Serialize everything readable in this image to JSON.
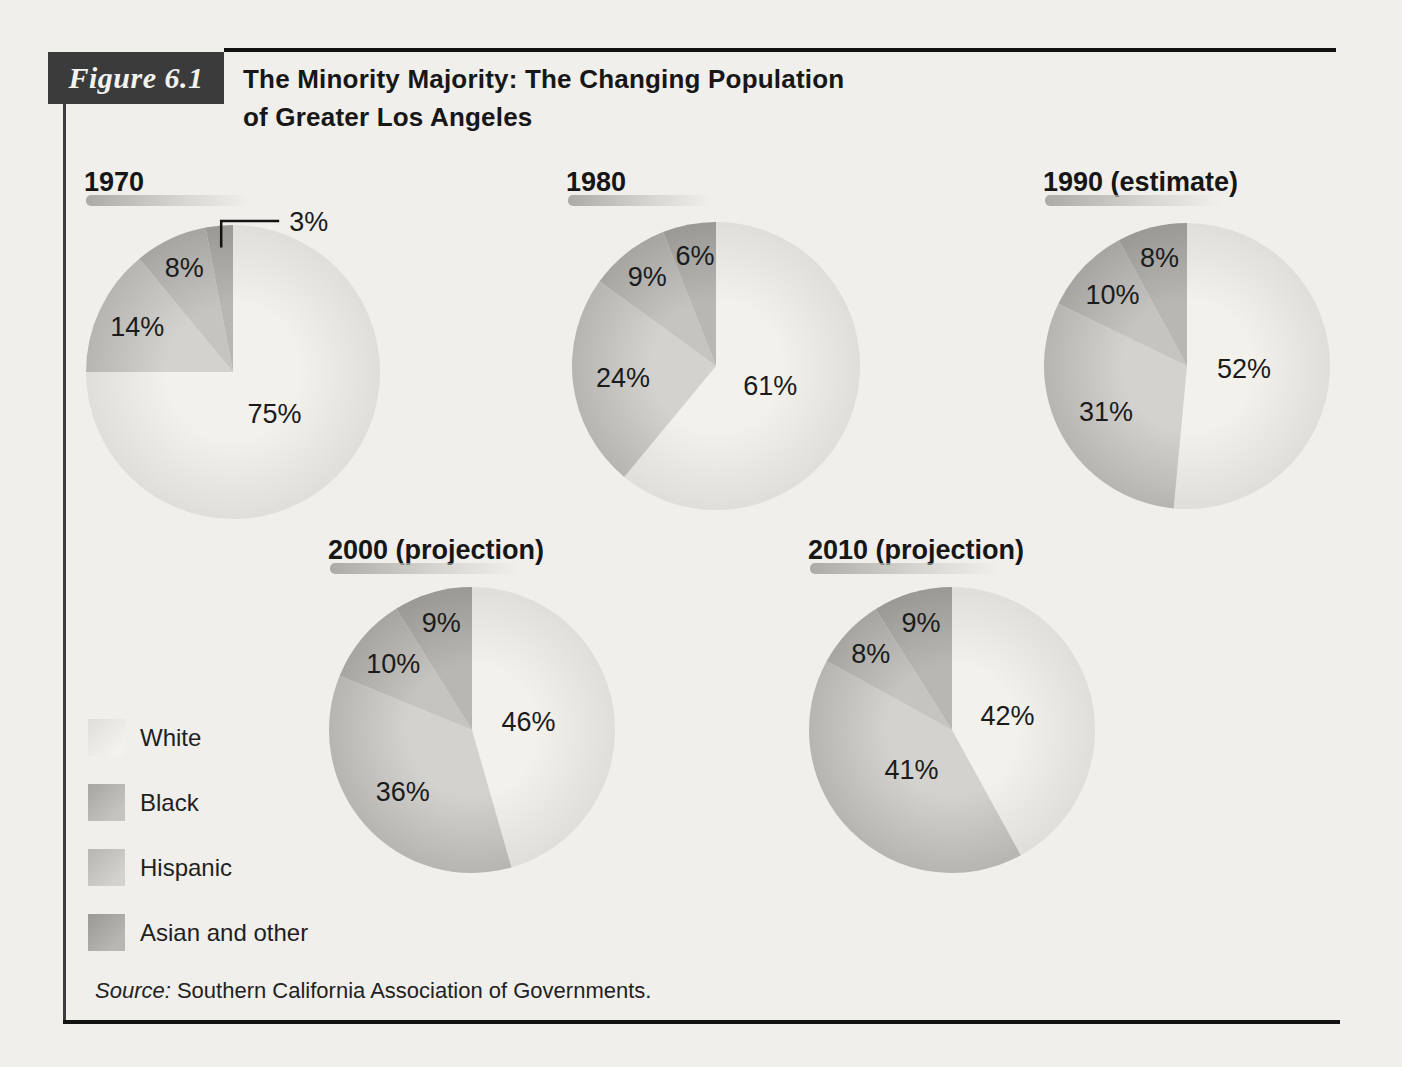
{
  "page": {
    "background": "#f0efeb"
  },
  "figure_header": {
    "label": "Figure 6.1",
    "title_line1": "The Minority Majority: The Changing Population",
    "title_line2": "of Greater Los Angeles"
  },
  "legend": {
    "items": [
      {
        "key": "white",
        "label": "White"
      },
      {
        "key": "black",
        "label": "Black"
      },
      {
        "key": "hispanic",
        "label": "Hispanic"
      },
      {
        "key": "asian",
        "label": "Asian and other"
      }
    ]
  },
  "source": {
    "prefix": "Source:",
    "text": " Southern California Association of Governments."
  },
  "colors": {
    "white": {
      "inner": "#f2f1ec",
      "outer": "#dfded8"
    },
    "hispanic": {
      "inner": "#d3d2ce",
      "outer": "#b6b5b1"
    },
    "black": {
      "inner": "#c5c4c0",
      "outer": "#a6a5a1"
    },
    "asian": {
      "inner": "#b8b7b3",
      "outer": "#9a9995"
    }
  },
  "chart_data": [
    {
      "type": "pie",
      "title": "1970",
      "note": "slices listed in clockwise order starting at 12 o'clock",
      "categories": [
        "White",
        "Hispanic",
        "Black",
        "Asian and other"
      ],
      "keys": [
        "white",
        "hispanic",
        "black",
        "asian"
      ],
      "values": [
        75,
        14,
        8,
        3
      ],
      "labels": [
        "75%",
        "14%",
        "8%",
        "3%"
      ],
      "callout_index": 3
    },
    {
      "type": "pie",
      "title": "1980",
      "categories": [
        "White",
        "Hispanic",
        "Black",
        "Asian and other"
      ],
      "keys": [
        "white",
        "hispanic",
        "black",
        "asian"
      ],
      "values": [
        61,
        24,
        9,
        6
      ],
      "labels": [
        "61%",
        "24%",
        "9%",
        "6%"
      ],
      "callout_index": null
    },
    {
      "type": "pie",
      "title": "1990 (estimate)",
      "categories": [
        "White",
        "Hispanic",
        "Black",
        "Asian and other"
      ],
      "keys": [
        "white",
        "hispanic",
        "black",
        "asian"
      ],
      "values": [
        52,
        31,
        10,
        8
      ],
      "labels": [
        "52%",
        "31%",
        "10%",
        "8%"
      ],
      "callout_index": null
    },
    {
      "type": "pie",
      "title": "2000 (projection)",
      "categories": [
        "White",
        "Hispanic",
        "Black",
        "Asian and other"
      ],
      "keys": [
        "white",
        "hispanic",
        "black",
        "asian"
      ],
      "values": [
        46,
        36,
        10,
        9
      ],
      "labels": [
        "46%",
        "36%",
        "10%",
        "9%"
      ],
      "callout_index": null
    },
    {
      "type": "pie",
      "title": "2010 (projection)",
      "categories": [
        "White",
        "Hispanic",
        "Black",
        "Asian and other"
      ],
      "keys": [
        "white",
        "hispanic",
        "black",
        "asian"
      ],
      "values": [
        42,
        41,
        8,
        9
      ],
      "labels": [
        "42%",
        "41%",
        "8%",
        "9%"
      ],
      "callout_index": null
    }
  ]
}
